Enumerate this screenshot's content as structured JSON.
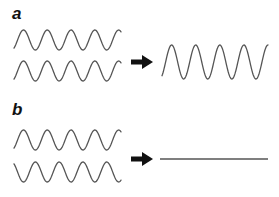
{
  "figure": {
    "panels": [
      {
        "label": "a",
        "description": "Two in-phase waves combine into a wave of larger amplitude (constructive interference)",
        "inputs": [
          {
            "name": "wave-1",
            "phase": "in-phase"
          },
          {
            "name": "wave-2",
            "phase": "in-phase"
          }
        ],
        "result": "amplified wave"
      },
      {
        "label": "b",
        "description": "Two out-of-phase waves cancel into a flat line (destructive interference)",
        "inputs": [
          {
            "name": "wave-1",
            "phase": "0"
          },
          {
            "name": "wave-2",
            "phase": "180"
          }
        ],
        "result": "flat line"
      }
    ],
    "colors": {
      "wave": "#555555",
      "arrow": "#111111",
      "label": "#111111"
    }
  }
}
